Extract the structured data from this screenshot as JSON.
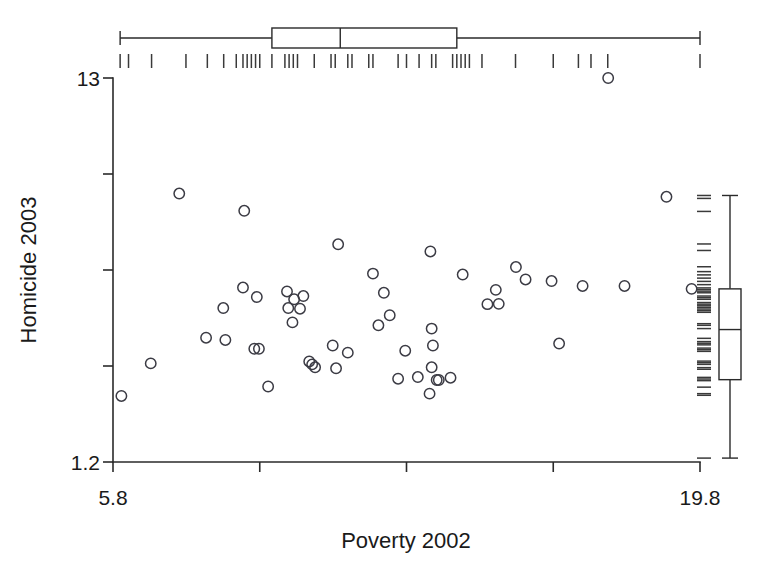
{
  "figure": {
    "background": "#ffffff",
    "foreground": "#1a1a1a",
    "point_color": "#3b3b44"
  },
  "axes": {
    "x_title": "Poverty 2002",
    "y_title": "Homicide 2003",
    "x_tick_labels": [
      "5.8",
      "19.8"
    ],
    "y_tick_labels": [
      "13",
      "1.2"
    ],
    "x_min_label": "5.8",
    "x_max_label": "19.8",
    "y_min_label": "1.2",
    "y_max_label": "13"
  },
  "chart_data": {
    "type": "scatter",
    "title": "",
    "xlabel": "Poverty 2002",
    "ylabel": "Homicide 2003",
    "xlim": [
      5.8,
      19.8
    ],
    "ylim": [
      1.2,
      13.0
    ],
    "grid": false,
    "legend": null,
    "xticks": [
      5.8,
      9.3,
      12.8,
      16.3,
      19.8
    ],
    "xtick_labels": [
      "5.8",
      "",
      "",
      "",
      "19.8"
    ],
    "yticks": [
      1.2,
      4.15,
      7.1,
      10.05,
      13.0
    ],
    "ytick_labels": [
      "1.2",
      "",
      "",
      "",
      "13"
    ],
    "marker": "open-circle",
    "points": [
      {
        "x": 17.61,
        "y": 13.0
      },
      {
        "x": 7.38,
        "y": 9.45
      },
      {
        "x": 8.93,
        "y": 8.92
      },
      {
        "x": 19.0,
        "y": 9.35
      },
      {
        "x": 11.17,
        "y": 7.89
      },
      {
        "x": 13.37,
        "y": 7.67
      },
      {
        "x": 15.41,
        "y": 7.19
      },
      {
        "x": 12.0,
        "y": 6.99
      },
      {
        "x": 14.14,
        "y": 6.96
      },
      {
        "x": 15.64,
        "y": 6.81
      },
      {
        "x": 16.26,
        "y": 6.76
      },
      {
        "x": 8.9,
        "y": 6.56
      },
      {
        "x": 17.0,
        "y": 6.61
      },
      {
        "x": 18.0,
        "y": 6.61
      },
      {
        "x": 12.26,
        "y": 6.4
      },
      {
        "x": 14.93,
        "y": 6.49
      },
      {
        "x": 19.6,
        "y": 6.52
      },
      {
        "x": 9.23,
        "y": 6.27
      },
      {
        "x": 9.95,
        "y": 6.44
      },
      {
        "x": 10.34,
        "y": 6.3
      },
      {
        "x": 10.12,
        "y": 6.2
      },
      {
        "x": 14.73,
        "y": 6.05
      },
      {
        "x": 15.0,
        "y": 6.06
      },
      {
        "x": 9.98,
        "y": 5.93
      },
      {
        "x": 10.26,
        "y": 5.91
      },
      {
        "x": 12.4,
        "y": 5.71
      },
      {
        "x": 8.43,
        "y": 5.93
      },
      {
        "x": 10.08,
        "y": 5.49
      },
      {
        "x": 12.13,
        "y": 5.4
      },
      {
        "x": 13.4,
        "y": 5.3
      },
      {
        "x": 8.02,
        "y": 5.02
      },
      {
        "x": 8.48,
        "y": 4.95
      },
      {
        "x": 16.44,
        "y": 4.84
      },
      {
        "x": 13.43,
        "y": 4.78
      },
      {
        "x": 9.17,
        "y": 4.68
      },
      {
        "x": 9.28,
        "y": 4.68
      },
      {
        "x": 11.04,
        "y": 4.78
      },
      {
        "x": 11.4,
        "y": 4.56
      },
      {
        "x": 12.77,
        "y": 4.62
      },
      {
        "x": 6.7,
        "y": 4.23
      },
      {
        "x": 10.48,
        "y": 4.29
      },
      {
        "x": 10.55,
        "y": 4.2
      },
      {
        "x": 10.62,
        "y": 4.11
      },
      {
        "x": 13.4,
        "y": 4.11
      },
      {
        "x": 11.12,
        "y": 4.08
      },
      {
        "x": 13.07,
        "y": 3.81
      },
      {
        "x": 12.6,
        "y": 3.76
      },
      {
        "x": 13.52,
        "y": 3.72
      },
      {
        "x": 13.57,
        "y": 3.72
      },
      {
        "x": 13.85,
        "y": 3.79
      },
      {
        "x": 9.5,
        "y": 3.52
      },
      {
        "x": 13.35,
        "y": 3.3
      },
      {
        "x": 6.0,
        "y": 3.23
      }
    ],
    "x_boxplot": {
      "orientation": "horizontal",
      "whisker_low": 5.97,
      "q1": 9.59,
      "median": 11.22,
      "q3": 14.0,
      "whisker_high": 19.8
    },
    "y_boxplot": {
      "orientation": "vertical",
      "whisker_low": 1.32,
      "q1": 3.73,
      "median": 5.27,
      "q3": 6.52,
      "whisker_high": 9.39
    },
    "x_rug_values": [
      5.97,
      6.17,
      6.72,
      7.54,
      8.05,
      8.44,
      8.74,
      8.9,
      9.0,
      9.1,
      9.2,
      9.3,
      9.59,
      9.9,
      10.0,
      10.1,
      10.2,
      10.6,
      11.0,
      11.1,
      11.4,
      11.5,
      11.9,
      12.0,
      12.6,
      12.8,
      13.1,
      13.4,
      13.5,
      13.9,
      14.0,
      14.1,
      14.2,
      14.3,
      14.6,
      15.4,
      16.3,
      16.9,
      17.2,
      17.6,
      19.8
    ],
    "y_rug_values": [
      9.39,
      9.3,
      8.9,
      7.9,
      7.7,
      7.2,
      7.05,
      6.95,
      6.85,
      6.75,
      6.65,
      6.55,
      6.5,
      6.45,
      6.4,
      6.3,
      6.25,
      6.2,
      6.1,
      6.05,
      6.0,
      5.95,
      5.9,
      5.85,
      5.8,
      5.45,
      5.4,
      5.3,
      5.0,
      4.9,
      4.85,
      4.8,
      4.7,
      4.65,
      4.6,
      4.3,
      4.25,
      4.2,
      4.1,
      4.05,
      3.8,
      3.75,
      3.7,
      3.5,
      3.3,
      3.25,
      1.32
    ]
  }
}
